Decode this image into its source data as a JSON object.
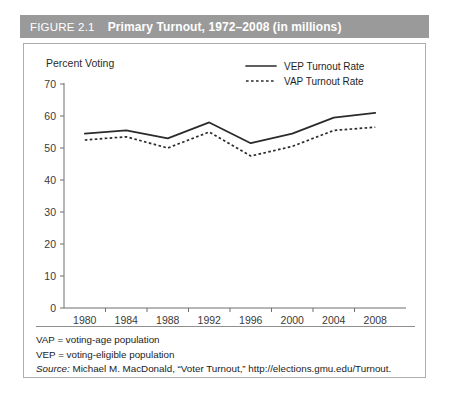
{
  "header": {
    "figure_number": "FIGURE 2.1",
    "title": "Primary Turnout, 1972–2008 (in millions)",
    "background_color": "#9a9a9a",
    "text_color": "#ffffff"
  },
  "chart_data": {
    "type": "line",
    "title": "",
    "ylabel": "Percent Voting",
    "xlabel": "",
    "x": [
      "1980",
      "1984",
      "1988",
      "1992",
      "1996",
      "2000",
      "2004",
      "2008"
    ],
    "categories": [
      "1980",
      "1984",
      "1988",
      "1992",
      "1996",
      "2000",
      "2004",
      "2008"
    ],
    "series": [
      {
        "name": "VEP Turnout Rate",
        "style": "solid",
        "color": "#2b2b2b",
        "values": [
          54.5,
          55.5,
          53.0,
          58.0,
          51.5,
          54.5,
          59.5,
          61.0
        ]
      },
      {
        "name": "VAP Turnout Rate",
        "style": "dotted",
        "color": "#2b2b2b",
        "values": [
          52.5,
          53.5,
          50.0,
          55.0,
          47.5,
          50.5,
          55.5,
          56.5
        ]
      }
    ],
    "ylim": [
      0,
      70
    ],
    "yticks": [
      "0",
      "10",
      "20",
      "30",
      "40",
      "50",
      "60",
      "70"
    ],
    "xticks": [
      "1980",
      "1984",
      "1988",
      "1992",
      "1996",
      "2000",
      "2004",
      "2008"
    ],
    "grid": false,
    "legend_position": "top-right",
    "legend": [
      "VEP Turnout Rate",
      "VAP Turnout Rate"
    ]
  },
  "legend": {
    "entries": [
      {
        "label": "VEP Turnout Rate",
        "style": "solid"
      },
      {
        "label": "VAP Turnout Rate",
        "style": "dotted"
      }
    ]
  },
  "footnotes": {
    "vap": "VAP = voting-age population",
    "vep": "VEP = voting-eligible population",
    "source_label": "Source:",
    "source_text": " Michael M. MacDonald, “Voter Turnout,” http://elections.gmu.edu/Turnout."
  }
}
